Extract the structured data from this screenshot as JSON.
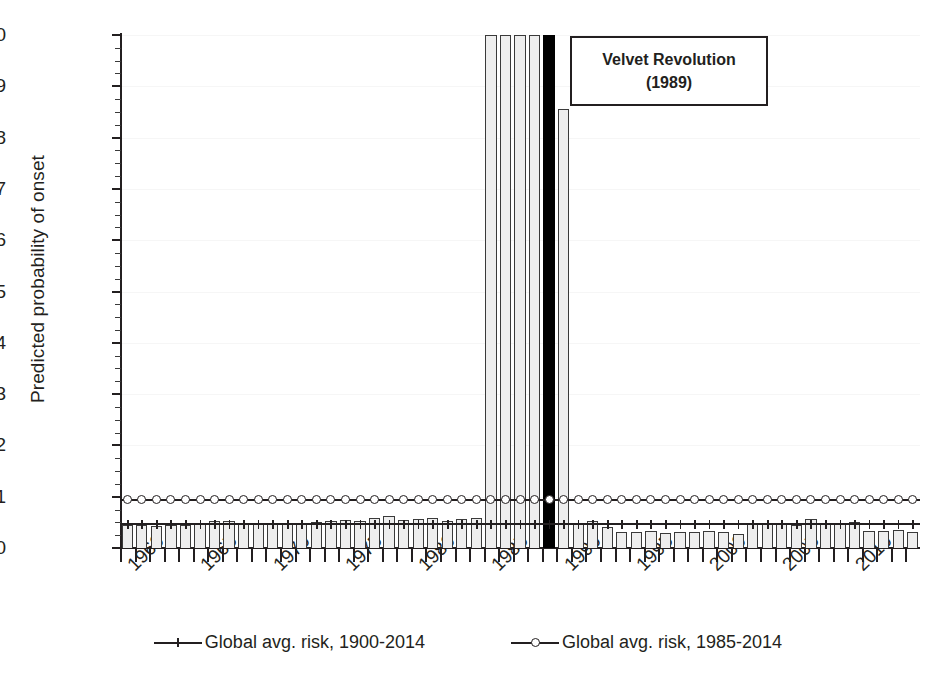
{
  "chart_data": {
    "type": "bar",
    "title": "",
    "xlabel": "",
    "ylabel": "Predicted probability of onset",
    "ylim": [
      0.0,
      0.1
    ],
    "xlim": [
      1959.5,
      2014.5
    ],
    "ytick_labels": [
      "0.10",
      "0.09",
      "0.08",
      "0.07",
      "0.06",
      "0.05",
      "0.04",
      "0.03",
      "0.02",
      "0.01",
      "0.00"
    ],
    "ytick_values": [
      0.1,
      0.09,
      0.08,
      0.07,
      0.06,
      0.05,
      0.04,
      0.03,
      0.02,
      0.01,
      0.0
    ],
    "ytick_minor_step": 0.0025,
    "xtick_labels": [
      "1960",
      "1965",
      "1970",
      "1975",
      "1980",
      "1985",
      "1990",
      "1995",
      "2000",
      "2005",
      "2010"
    ],
    "xtick_values": [
      1960,
      1965,
      1970,
      1975,
      1980,
      1985,
      1990,
      1995,
      2000,
      2005,
      2010
    ],
    "grid": "faint-horizontal",
    "legend_position": "bottom-center",
    "bar_label": "Predicted probability of onset (annual)",
    "highlight_year": 1989,
    "highlight_color": "#000000",
    "bar_fill_color": "#eeeeee",
    "bar_edge_color": "#3a3a3a",
    "categories": [
      1960,
      1961,
      1962,
      1963,
      1964,
      1965,
      1966,
      1967,
      1968,
      1969,
      1970,
      1971,
      1972,
      1973,
      1974,
      1975,
      1976,
      1977,
      1978,
      1979,
      1980,
      1981,
      1982,
      1983,
      1984,
      1985,
      1986,
      1987,
      1988,
      1989,
      1990,
      1991,
      1992,
      1993,
      1994,
      1995,
      1996,
      1997,
      1998,
      1999,
      2000,
      2001,
      2002,
      2003,
      2004,
      2005,
      2006,
      2007,
      2008,
      2009,
      2010,
      2011,
      2012,
      2013,
      2014
    ],
    "values": [
      0.0044,
      0.0044,
      0.0043,
      0.0044,
      0.0045,
      0.0046,
      0.0052,
      0.0053,
      0.0047,
      0.0048,
      0.0048,
      0.0049,
      0.0049,
      0.005,
      0.0052,
      0.0055,
      0.0053,
      0.0058,
      0.0062,
      0.0055,
      0.0057,
      0.0058,
      0.0053,
      0.0056,
      0.0058,
      0.1,
      0.1,
      0.1,
      0.1,
      0.1,
      0.0856,
      0.0048,
      0.0053,
      0.004,
      0.0031,
      0.0032,
      0.0034,
      0.003,
      0.0031,
      0.0032,
      0.0034,
      0.0031,
      0.0028,
      0.0046,
      0.0047,
      0.0046,
      0.0045,
      0.0057,
      0.0049,
      0.0048,
      0.005,
      0.0033,
      0.0033,
      0.0036,
      0.0032
    ],
    "series": [
      {
        "name": "Global avg. risk, 1900-2014",
        "type": "line",
        "marker": "plus",
        "value": 0.0046,
        "constant": true
      },
      {
        "name": "Global avg. risk, 1985-2014",
        "type": "line",
        "marker": "circle",
        "value": 0.0094,
        "constant": true
      }
    ],
    "annotations": [
      {
        "id": "velvet-revolution",
        "line1": "Velvet Revolution",
        "line2": "(1989)",
        "points_to_year": 1989
      }
    ]
  },
  "legend": {
    "items": [
      {
        "label": "Global avg. risk, 1900-2014",
        "marker": "plus"
      },
      {
        "label": "Global avg. risk, 1985-2014",
        "marker": "circle"
      }
    ]
  },
  "annotation": {
    "line1": "Velvet Revolution",
    "line2": "(1989)"
  }
}
